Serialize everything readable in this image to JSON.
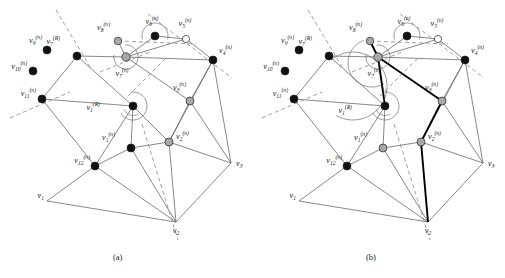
{
  "figure": {
    "panels": [
      {
        "id": "a",
        "caption": "(a)"
      },
      {
        "id": "b",
        "caption": "(b)"
      }
    ],
    "caption_a": "(a)",
    "caption_b": "(b)"
  },
  "legend_colors": {
    "black_node": "#111111",
    "gray_node": "#a8a8a8",
    "white_node": "#ffffff",
    "edge": "#555555",
    "bold_edge": "#000000",
    "dashed_line": "#888888",
    "text": "#1a1a1a"
  },
  "panel_a": {
    "caption": "(a)",
    "nodes": [
      {
        "name": "v1R",
        "label": "v",
        "sub": "1",
        "sup": "(R)",
        "x": 133,
        "y": 106,
        "fill": "black",
        "r": 4.0,
        "lx": 100,
        "ly": 110,
        "anchor": "end"
      },
      {
        "name": "v7R",
        "label": "v",
        "sub": "7",
        "sup": "(R)",
        "x": 77,
        "y": 56,
        "fill": "black",
        "r": 4.0,
        "lx": 60,
        "ly": 44,
        "anchor": "end"
      },
      {
        "name": "v1n",
        "label": "v",
        "sub": "1",
        "sup": "(n)",
        "x": 131,
        "y": 148,
        "fill": "black",
        "r": 4.0,
        "lx": 115,
        "ly": 140,
        "anchor": "end"
      },
      {
        "name": "v2n",
        "label": "v",
        "sub": "2",
        "sup": "(n)",
        "x": 169,
        "y": 142,
        "fill": "gray",
        "r": 4.0,
        "lx": 176,
        "ly": 139,
        "anchor": "start"
      },
      {
        "name": "v3n",
        "label": "v",
        "sub": "3",
        "sup": "(n)",
        "x": 190,
        "y": 101,
        "fill": "gray",
        "r": 4.0,
        "lx": 186,
        "ly": 90,
        "anchor": "end"
      },
      {
        "name": "v4n",
        "label": "v",
        "sub": "4",
        "sup": "(n)",
        "x": 213,
        "y": 60,
        "fill": "black",
        "r": 4.0,
        "lx": 219,
        "ly": 53,
        "anchor": "start"
      },
      {
        "name": "v5n",
        "label": "v",
        "sub": "5",
        "sup": "(n)",
        "x": 186,
        "y": 39,
        "fill": "white",
        "r": 3.6,
        "lx": 185,
        "ly": 26,
        "anchor": "middle"
      },
      {
        "name": "v6n",
        "label": "v",
        "sub": "6",
        "sup": "(n)",
        "x": 155,
        "y": 36,
        "fill": "black",
        "r": 4.0,
        "lx": 152,
        "ly": 24,
        "anchor": "middle"
      },
      {
        "name": "v7n",
        "label": "v",
        "sub": "7",
        "sup": "(n)",
        "x": 126,
        "y": 57,
        "fill": "gray",
        "r": 4.2,
        "lx": 122,
        "ly": 76,
        "anchor": "middle"
      },
      {
        "name": "v8n",
        "label": "v",
        "sub": "8",
        "sup": "(n)",
        "x": 118,
        "y": 41,
        "fill": "gray",
        "r": 3.8,
        "lx": 110,
        "ly": 30,
        "anchor": "end"
      },
      {
        "name": "v9n",
        "label": "v",
        "sub": "9",
        "sup": "(n)",
        "x": 47,
        "y": 50,
        "fill": "black",
        "r": 4.0,
        "lx": 42,
        "ly": 43,
        "anchor": "end"
      },
      {
        "name": "v10n",
        "label": "v",
        "sub": "10",
        "sup": "(n)",
        "x": 33,
        "y": 71,
        "fill": "black",
        "r": 4.0,
        "lx": 27,
        "ly": 69,
        "anchor": "end"
      },
      {
        "name": "v11n",
        "label": "v",
        "sub": "11",
        "sup": "(n)",
        "x": 42,
        "y": 99,
        "fill": "black",
        "r": 4.0,
        "lx": 36,
        "ly": 96,
        "anchor": "end"
      },
      {
        "name": "v12n",
        "label": "v",
        "sub": "12",
        "sup": "(n)",
        "x": 95,
        "y": 166,
        "fill": "black",
        "r": 4.0,
        "lx": 90,
        "ly": 163,
        "anchor": "end"
      },
      {
        "name": "v1",
        "label": "v",
        "sub": "1",
        "sup": "",
        "x": 47,
        "y": 201,
        "fill": "none",
        "r": 0,
        "lx": 44,
        "ly": 198,
        "anchor": "end"
      },
      {
        "name": "v2",
        "label": "v",
        "sub": "2",
        "sup": "",
        "x": 176,
        "y": 222,
        "fill": "none",
        "r": 0,
        "lx": 176,
        "ly": 233,
        "anchor": "middle"
      },
      {
        "name": "v3",
        "label": "v",
        "sub": "3",
        "sup": "",
        "x": 231,
        "y": 163,
        "fill": "none",
        "r": 0,
        "lx": 236,
        "ly": 166,
        "anchor": "start"
      }
    ],
    "edges": [
      [
        "v7R",
        "v7n"
      ],
      [
        "v7R",
        "v11n"
      ],
      [
        "v7R",
        "v1R"
      ],
      [
        "v7n",
        "v8n"
      ],
      [
        "v7n",
        "v6n"
      ],
      [
        "v7n",
        "v5n"
      ],
      [
        "v7n",
        "v4n"
      ],
      [
        "v7n",
        "v3n"
      ],
      [
        "v6n",
        "v5n"
      ],
      [
        "v5n",
        "v4n"
      ],
      [
        "v4n",
        "v3n"
      ],
      [
        "v4n",
        "v3"
      ],
      [
        "v4n",
        "v2n"
      ],
      [
        "v3n",
        "v2n"
      ],
      [
        "v3n",
        "v3"
      ],
      [
        "v1R",
        "v11n"
      ],
      [
        "v1R",
        "v12n"
      ],
      [
        "v1R",
        "v1n"
      ],
      [
        "v1R",
        "v2n"
      ],
      [
        "v1n",
        "v12n"
      ],
      [
        "v1n",
        "v2n"
      ],
      [
        "v1n",
        "v2"
      ],
      [
        "v11n",
        "v12n"
      ],
      [
        "v12n",
        "v1"
      ],
      [
        "v12n",
        "v2"
      ],
      [
        "v2n",
        "v2"
      ],
      [
        "v2n",
        "v3"
      ],
      [
        "v1",
        "v2"
      ],
      [
        "v2",
        "v3"
      ]
    ],
    "bold_edges": []
  },
  "panel_b": {
    "caption": "(b)",
    "nodes": [
      {
        "name": "v1R",
        "label": "v",
        "sub": "1",
        "sup": "(R)",
        "x": 385,
        "y": 106,
        "fill": "black",
        "r": 4.0,
        "lx": 352,
        "ly": 113,
        "anchor": "end"
      },
      {
        "name": "v7R",
        "label": "v",
        "sub": "7",
        "sup": "(R)",
        "x": 329,
        "y": 56,
        "fill": "black",
        "r": 4.0,
        "lx": 312,
        "ly": 44,
        "anchor": "end"
      },
      {
        "name": "v1n",
        "label": "v",
        "sub": "1",
        "sup": "(n)",
        "x": 383,
        "y": 148,
        "fill": "gray",
        "r": 4.0,
        "lx": 367,
        "ly": 140,
        "anchor": "end"
      },
      {
        "name": "v2n",
        "label": "v",
        "sub": "2",
        "sup": "(n)",
        "x": 421,
        "y": 142,
        "fill": "gray",
        "r": 4.0,
        "lx": 428,
        "ly": 139,
        "anchor": "start"
      },
      {
        "name": "v3n",
        "label": "v",
        "sub": "3",
        "sup": "(n)",
        "x": 442,
        "y": 101,
        "fill": "gray",
        "r": 4.0,
        "lx": 438,
        "ly": 90,
        "anchor": "end"
      },
      {
        "name": "v4n",
        "label": "v",
        "sub": "4",
        "sup": "(n)",
        "x": 465,
        "y": 60,
        "fill": "black",
        "r": 4.0,
        "lx": 471,
        "ly": 53,
        "anchor": "start"
      },
      {
        "name": "v5n",
        "label": "v",
        "sub": "5",
        "sup": "(n)",
        "x": 438,
        "y": 39,
        "fill": "white",
        "r": 3.6,
        "lx": 437,
        "ly": 26,
        "anchor": "middle"
      },
      {
        "name": "v6n",
        "label": "v",
        "sub": "6",
        "sup": "(n)",
        "x": 407,
        "y": 36,
        "fill": "black",
        "r": 4.0,
        "lx": 404,
        "ly": 24,
        "anchor": "middle"
      },
      {
        "name": "v7n",
        "label": "v",
        "sub": "7",
        "sup": "(n)",
        "x": 378,
        "y": 57,
        "fill": "gray",
        "r": 4.2,
        "lx": 374,
        "ly": 76,
        "anchor": "middle"
      },
      {
        "name": "v8n",
        "label": "v",
        "sub": "8",
        "sup": "(n)",
        "x": 370,
        "y": 41,
        "fill": "gray",
        "r": 3.8,
        "lx": 362,
        "ly": 30,
        "anchor": "end"
      },
      {
        "name": "v9n",
        "label": "v",
        "sub": "9",
        "sup": "(n)",
        "x": 299,
        "y": 50,
        "fill": "black",
        "r": 4.0,
        "lx": 294,
        "ly": 43,
        "anchor": "end"
      },
      {
        "name": "v10n",
        "label": "v",
        "sub": "10",
        "sup": "(n)",
        "x": 285,
        "y": 71,
        "fill": "black",
        "r": 4.0,
        "lx": 279,
        "ly": 69,
        "anchor": "end"
      },
      {
        "name": "v11n",
        "label": "v",
        "sub": "11",
        "sup": "(n)",
        "x": 294,
        "y": 99,
        "fill": "black",
        "r": 4.0,
        "lx": 288,
        "ly": 96,
        "anchor": "end"
      },
      {
        "name": "v12n",
        "label": "v",
        "sub": "12",
        "sup": "(n)",
        "x": 347,
        "y": 166,
        "fill": "black",
        "r": 4.0,
        "lx": 342,
        "ly": 163,
        "anchor": "end"
      },
      {
        "name": "v1",
        "label": "v",
        "sub": "1",
        "sup": "",
        "x": 299,
        "y": 201,
        "fill": "none",
        "r": 0,
        "lx": 296,
        "ly": 198,
        "anchor": "end"
      },
      {
        "name": "v2",
        "label": "v",
        "sub": "2",
        "sup": "",
        "x": 428,
        "y": 222,
        "fill": "none",
        "r": 0,
        "lx": 428,
        "ly": 233,
        "anchor": "middle"
      },
      {
        "name": "v3",
        "label": "v",
        "sub": "3",
        "sup": "",
        "x": 483,
        "y": 163,
        "fill": "none",
        "r": 0,
        "lx": 488,
        "ly": 166,
        "anchor": "start"
      }
    ],
    "edges": [
      [
        "v7R",
        "v7n"
      ],
      [
        "v7R",
        "v11n"
      ],
      [
        "v7R",
        "v1R"
      ],
      [
        "v7n",
        "v6n"
      ],
      [
        "v7n",
        "v5n"
      ],
      [
        "v7n",
        "v4n"
      ],
      [
        "v6n",
        "v5n"
      ],
      [
        "v5n",
        "v4n"
      ],
      [
        "v4n",
        "v3n"
      ],
      [
        "v4n",
        "v3"
      ],
      [
        "v4n",
        "v2n"
      ],
      [
        "v3n",
        "v2n"
      ],
      [
        "v3n",
        "v3"
      ],
      [
        "v1R",
        "v11n"
      ],
      [
        "v1R",
        "v12n"
      ],
      [
        "v1R",
        "v1n"
      ],
      [
        "v1n",
        "v12n"
      ],
      [
        "v1n",
        "v2n"
      ],
      [
        "v1n",
        "v2"
      ],
      [
        "v11n",
        "v12n"
      ],
      [
        "v12n",
        "v1"
      ],
      [
        "v12n",
        "v2"
      ],
      [
        "v2n",
        "v3"
      ],
      [
        "v1",
        "v2"
      ],
      [
        "v2",
        "v3"
      ]
    ],
    "bold_edges": [
      [
        "v7n",
        "v8n"
      ],
      [
        "v7n",
        "v1R"
      ],
      [
        "v7n",
        "v3n"
      ],
      [
        "v3n",
        "v2n"
      ],
      [
        "v2n",
        "v2"
      ]
    ]
  }
}
